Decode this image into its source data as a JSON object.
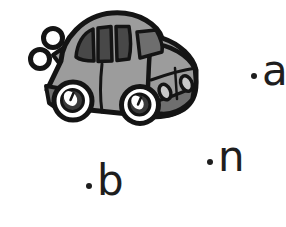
{
  "background_color": "#ffffff",
  "illustration": {
    "name": "wind-up-toy-car",
    "description": "Cartoon gray wind-up toy car with a key on its back, facing right",
    "colors": {
      "outline": "#141414",
      "body": "#9c9c9c",
      "window": "#484848",
      "windshield": "#6e6e6e",
      "headlight": "#c8c8c8",
      "bumper": "#6f6f6f",
      "tire": "#ffffff",
      "hub": "#3a3a3a",
      "key": "#ffffff",
      "letter": "#1e1e1e"
    }
  },
  "options": [
    {
      "label": "a"
    },
    {
      "label": "n"
    },
    {
      "label": "b"
    }
  ]
}
